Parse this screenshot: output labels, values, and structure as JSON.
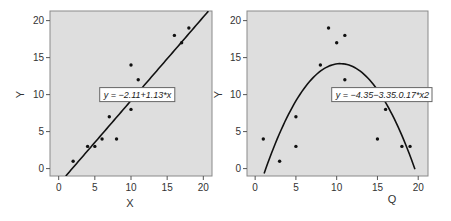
{
  "chart_data": [
    {
      "type": "scatter",
      "panel": "left",
      "title": "",
      "xlabel": "X",
      "ylabel": "Y",
      "xlim": [
        -1.2,
        21.2
      ],
      "ylim": [
        -1,
        21.3
      ],
      "xticks": [
        0,
        5,
        10,
        15,
        20
      ],
      "yticks": [
        0,
        5,
        10,
        15,
        20
      ],
      "grid": false,
      "points": [
        {
          "x": 2,
          "y": 1
        },
        {
          "x": 4,
          "y": 3
        },
        {
          "x": 5,
          "y": 3
        },
        {
          "x": 6,
          "y": 4
        },
        {
          "x": 7,
          "y": 7
        },
        {
          "x": 8,
          "y": 4
        },
        {
          "x": 10,
          "y": 14
        },
        {
          "x": 10,
          "y": 8
        },
        {
          "x": 11,
          "y": 12
        },
        {
          "x": 16,
          "y": 18
        },
        {
          "x": 17,
          "y": 17
        },
        {
          "x": 18,
          "y": 19
        }
      ],
      "fit": {
        "kind": "linear",
        "intercept": -2.11,
        "slope": 1.13,
        "x_range": [
          0.98,
          20.7
        ]
      },
      "annotation": {
        "text": "y = −2.11+1.13*x",
        "x": 10.9,
        "y": 10
      }
    },
    {
      "type": "scatter",
      "panel": "right",
      "title": "",
      "xlabel": "Q",
      "ylabel": "Y",
      "xlim": [
        -1,
        21.2
      ],
      "ylim": [
        -1,
        21.3
      ],
      "xticks": [
        0,
        5,
        10,
        15,
        20
      ],
      "yticks": [
        0,
        5,
        10,
        15,
        20
      ],
      "grid": false,
      "points": [
        {
          "x": 1,
          "y": 4
        },
        {
          "x": 3,
          "y": 1
        },
        {
          "x": 5,
          "y": 7
        },
        {
          "x": 5,
          "y": 3
        },
        {
          "x": 8,
          "y": 14
        },
        {
          "x": 9,
          "y": 19
        },
        {
          "x": 10,
          "y": 17
        },
        {
          "x": 11,
          "y": 18
        },
        {
          "x": 11,
          "y": 12
        },
        {
          "x": 15,
          "y": 4
        },
        {
          "x": 16,
          "y": 8
        },
        {
          "x": 18,
          "y": 3
        },
        {
          "x": 19,
          "y": 3
        }
      ],
      "fit": {
        "kind": "quadratic",
        "a": -0.17,
        "b": 3.55,
        "c": -4.35,
        "x_range": [
          1.1,
          19.6
        ]
      },
      "annotation": {
        "text": "y = −4.35−3.35.0.17*x2",
        "x": 15.6,
        "y": 10
      }
    }
  ]
}
